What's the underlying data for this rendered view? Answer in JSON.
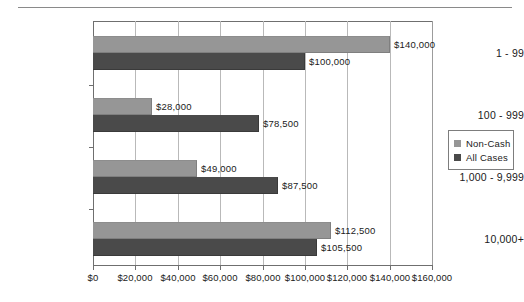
{
  "chart_data": {
    "type": "bar",
    "orientation": "horizontal",
    "title": "",
    "xlabel": "",
    "ylabel": "",
    "categories": [
      "1 - 99",
      "100 - 999",
      "1,000 - 9,999",
      "10,000+"
    ],
    "series": [
      {
        "name": "Non-Cash",
        "color": "#969696",
        "values": [
          140000,
          28000,
          49000,
          112500
        ],
        "labels": [
          "$140,000",
          "$28,000",
          "$49,000",
          "$112,500"
        ]
      },
      {
        "name": "All Cases",
        "color": "#4a4a4a",
        "values": [
          100000,
          78500,
          87500,
          105500
        ],
        "labels": [
          "$100,000",
          "$78,500",
          "$87,500",
          "$105,500"
        ]
      }
    ],
    "xlim": [
      0,
      160000
    ],
    "xticks": [
      0,
      20000,
      40000,
      60000,
      80000,
      100000,
      120000,
      140000,
      160000
    ],
    "xticklabels": [
      "$0",
      "$20,000",
      "$40,000",
      "$60,000",
      "$80,000",
      "$100,000",
      "$120,000",
      "$140,000",
      "$160,000"
    ],
    "grid": "vertical",
    "legend_position": "right"
  },
  "legend": {
    "items": [
      {
        "label": "Non-Cash",
        "color": "#969696"
      },
      {
        "label": "All Cases",
        "color": "#4a4a4a"
      }
    ]
  }
}
